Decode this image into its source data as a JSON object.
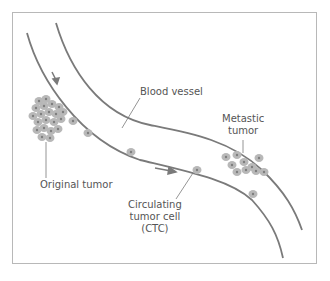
{
  "diagram": {
    "type": "metastasis-illustration",
    "colors": {
      "vessel_line": "#7a7a7a",
      "cell_fill": "#b5b5b5",
      "cell_nucleus": "#8a8a8a",
      "frame": "#b8b8b8",
      "label_text": "#555555"
    },
    "labels": {
      "blood_vessel": "Blood vessel",
      "metastatic_tumor_line1": "Metastic",
      "metastatic_tumor_line2": "tumor",
      "original_tumor": "Original tumor",
      "ctc_line1": "Circulating",
      "ctc_line2": "tumor cell",
      "ctc_line3": "(CTC)"
    },
    "arrows": [
      {
        "name": "flow-arrow-top",
        "direction": "down-right"
      },
      {
        "name": "flow-arrow-middle",
        "direction": "right"
      }
    ]
  }
}
